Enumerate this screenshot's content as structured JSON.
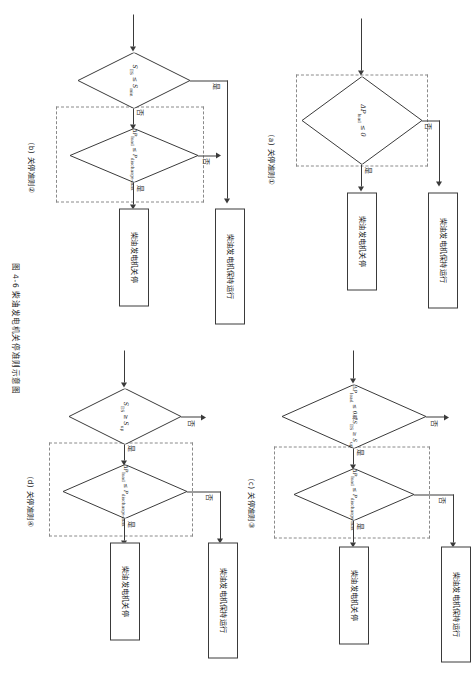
{
  "document": {
    "figure_caption": "图 4-6  柴油发电机关停准则示意图",
    "page_orientation_deg": 90
  },
  "common_labels": {
    "yes": "是",
    "no": "否",
    "keep_running": "柴油发电机保持运行",
    "shutdown": "柴油发电机关停"
  },
  "subfigures": [
    {
      "id": "a",
      "caption": "(a)  关停准则①",
      "decisions": [
        {
          "id": "a-d1",
          "text": "ΔP",
          "sub": "load",
          "rest": " ≤ 0"
        }
      ],
      "boxes": [
        {
          "id": "a-keep",
          "text": "柴油发电机保持运行"
        },
        {
          "id": "a-stop",
          "text": "柴油发电机关停"
        }
      ],
      "branch_labels": {
        "yes": "是",
        "no": "否"
      }
    },
    {
      "id": "b",
      "caption": "(b)  关停准则②",
      "decisions": [
        {
          "id": "b-d1",
          "text": "S",
          "sub": "ES",
          "rest": " ≤ S",
          "sub2": "min"
        },
        {
          "id": "b-d2",
          "text": "ΔP",
          "sub": "load",
          "rest": " ≤ P",
          "sub2": "discharge-max"
        }
      ],
      "boxes": [
        {
          "id": "b-keep",
          "text": "柴油发电机保持运行"
        },
        {
          "id": "b-stop",
          "text": "柴油发电机关停"
        }
      ],
      "branch_labels": {
        "yes": "是",
        "no": "否"
      }
    },
    {
      "id": "c",
      "caption": "(c)  关停准则③",
      "decisions": [
        {
          "id": "c-d1",
          "text": "ΔP",
          "sub": "load",
          "rest": " ≤ 0或S",
          "sub2": "ES",
          "rest2": " ≥ S",
          "sub3": "up"
        },
        {
          "id": "c-d2",
          "text": "ΔP",
          "sub": "load",
          "rest": " ≤ P",
          "sub2": "discharge-max"
        }
      ],
      "boxes": [
        {
          "id": "c-keep",
          "text": "柴油发电机保持运行"
        },
        {
          "id": "c-stop",
          "text": "柴油发电机关停"
        }
      ],
      "branch_labels": {
        "yes": "是",
        "no": "否"
      }
    },
    {
      "id": "d",
      "caption": "(d)  关停准则④",
      "decisions": [
        {
          "id": "d-d1",
          "text": "S",
          "sub": "ES",
          "rest": " ≥ S",
          "sub2": "up"
        },
        {
          "id": "d-d2",
          "text": "ΔP",
          "sub": "load",
          "rest": " ≤ P",
          "sub2": "discharge-max"
        }
      ],
      "boxes": [
        {
          "id": "d-keep",
          "text": "柴油发电机保持运行"
        },
        {
          "id": "d-stop",
          "text": "柴油发电机关停"
        }
      ],
      "branch_labels": {
        "yes": "是",
        "no": "否"
      }
    }
  ],
  "colors": {
    "stroke": "#3a3a3a",
    "dashed": "#8a8a8a",
    "text": "#1a1a1a",
    "background": "#ffffff"
  }
}
